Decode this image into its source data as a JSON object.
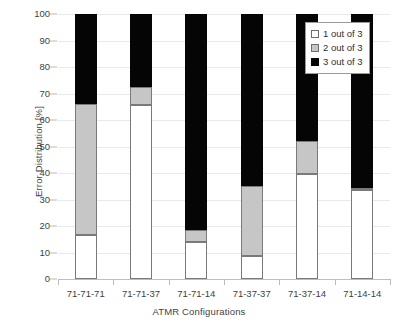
{
  "chart_data": {
    "type": "bar",
    "subtype": "stacked-bar-vertical",
    "title": "",
    "xlabel": "ATMR Configurations",
    "ylabel": "Error Distribution [%]",
    "ylim": [
      0,
      100
    ],
    "ytick_step": 10,
    "yticks": [
      0,
      10,
      20,
      30,
      40,
      50,
      60,
      70,
      80,
      90,
      100
    ],
    "grid": true,
    "grid_axis": "y",
    "legend_position": "top-right",
    "categories": [
      "71-71-71",
      "71-71-37",
      "71-71-14",
      "71-37-37",
      "71-37-14",
      "71-14-14"
    ],
    "series": [
      {
        "name": "1 out of 3",
        "color": "#ffffff",
        "values": [
          16.5,
          65.5,
          14.0,
          8.5,
          39.5,
          33.5
        ]
      },
      {
        "name": "2 out of 3",
        "color": "#c6c6c6",
        "values": [
          49.5,
          7.0,
          4.5,
          26.5,
          12.5,
          1.0
        ]
      },
      {
        "name": "3 out of 3",
        "color": "#050505",
        "values": [
          34.0,
          27.5,
          81.5,
          65.0,
          48.0,
          65.5
        ]
      }
    ],
    "cumulative_tops": {
      "1 out of 3": [
        16.5,
        65.5,
        14.0,
        8.5,
        39.5,
        33.5
      ],
      "2 out of 3": [
        66.0,
        72.5,
        18.5,
        35.0,
        52.0,
        34.5
      ],
      "3 out of 3": [
        100,
        100,
        100,
        100,
        100,
        100
      ]
    }
  },
  "axes": {
    "y_title": "Error Distribution [%]",
    "x_title": "ATMR Configurations",
    "y_tick_labels": [
      "100",
      "90",
      "80",
      "70",
      "60",
      "50",
      "40",
      "30",
      "20",
      "10",
      "0"
    ],
    "x_tick_labels": [
      "71-71-71",
      "71-71-37",
      "71-71-14",
      "71-37-37",
      "71-37-14",
      "71-14-14"
    ]
  },
  "legend": {
    "items": [
      {
        "label": "1 out of 3",
        "swatch": "white-square-icon"
      },
      {
        "label": "2 out of 3",
        "swatch": "gray-square-icon"
      },
      {
        "label": "3 out of 3",
        "swatch": "black-square-icon"
      }
    ]
  },
  "colors": {
    "series1": "#ffffff",
    "series2": "#c6c6c6",
    "series3": "#050505",
    "gridline": "#e9e9e9",
    "axis": "#bdbdbd",
    "text": "#3f3f3f"
  }
}
